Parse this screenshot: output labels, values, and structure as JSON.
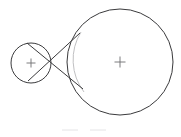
{
  "figure": {
    "canvas": {
      "width": 181,
      "height": 137,
      "background": "#ffffff"
    },
    "colors": {
      "outline": "#3a3a3c",
      "faint_arc": "#b9b9bb",
      "center_marker": "#6d6d70",
      "ghost_mark": "#e4e4e6"
    },
    "small_circle": {
      "name": "small-circle",
      "center_x": 31,
      "center_y": 63,
      "radius": 20,
      "center_marker_size": 9
    },
    "large_circle": {
      "name": "large-circle",
      "center_x": 120,
      "center_y": 62,
      "radius": 53,
      "center_marker_size": 11
    },
    "tangent_upper": {
      "name": "upper-internal-tangent",
      "x1": 27,
      "y1": 43,
      "x2": 83,
      "y2": 89
    },
    "tangent_lower": {
      "name": "lower-internal-tangent",
      "x1": 28,
      "y1": 81,
      "x2": 80,
      "y2": 33
    },
    "crossing_point": {
      "x": 50,
      "y": 62
    },
    "faint_arc": {
      "name": "inner-faint-arc",
      "start_x": 81,
      "start_y": 32,
      "end_x": 84,
      "end_y": 92,
      "radius": 53,
      "sweep": 0
    },
    "ghost_mark_left": {
      "x1": 62,
      "y1": 130,
      "x2": 78,
      "y2": 130
    },
    "ghost_mark_right": {
      "x1": 90,
      "y1": 130,
      "x2": 106,
      "y2": 130
    }
  }
}
